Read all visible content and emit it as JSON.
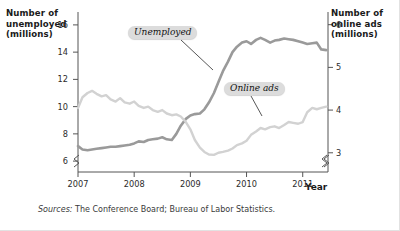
{
  "figure": {
    "sources_prefix": "Sources:",
    "sources_text": " The Conference Board; Bureau of Labor Statistics."
  },
  "chart_data": {
    "type": "line",
    "title": "",
    "xlabel": "Year",
    "ylabel": "Number of unemployed (millions)",
    "y2label": "Number of online ads (millions)",
    "axis_left_title_lines": [
      "Number of",
      "unemployed",
      "(millions)"
    ],
    "axis_right_title_lines": [
      "Number of",
      "online ads",
      "(millions)"
    ],
    "grid": false,
    "legend_position": "inline-annotations",
    "axis_break_left": true,
    "axis_break_right": true,
    "axis_break_x": true,
    "xlim": [
      2007.0,
      2011.45
    ],
    "xticks": [
      2007,
      2008,
      2009,
      2010,
      2011
    ],
    "xtick_labels": [
      "2007",
      "2008",
      "2009",
      "2010",
      "2011"
    ],
    "ylim": [
      5.2,
      16.8
    ],
    "yticks": [
      6,
      8,
      10,
      12,
      14,
      16
    ],
    "ytick_labels": [
      "6",
      "8",
      "10",
      "12",
      "14",
      "16"
    ],
    "y2lim": [
      2.55,
      6.25
    ],
    "y2ticks": [
      3,
      4,
      5,
      6
    ],
    "y2tick_labels": [
      "3",
      "4",
      "5",
      "6"
    ],
    "series": [
      {
        "name": "Unemployed",
        "axis": "left",
        "color": "#9a9a9a",
        "units": "millions",
        "x": [
          2007.0,
          2007.08,
          2007.17,
          2007.25,
          2007.33,
          2007.42,
          2007.5,
          2007.58,
          2007.67,
          2007.75,
          2007.83,
          2007.92,
          2008.0,
          2008.08,
          2008.17,
          2008.25,
          2008.33,
          2008.42,
          2008.5,
          2008.58,
          2008.67,
          2008.75,
          2008.83,
          2008.92,
          2009.0,
          2009.08,
          2009.17,
          2009.25,
          2009.33,
          2009.42,
          2009.5,
          2009.58,
          2009.67,
          2009.75,
          2009.83,
          2009.92,
          2010.0,
          2010.08,
          2010.17,
          2010.25,
          2010.33,
          2010.42,
          2010.5,
          2010.58,
          2010.67,
          2010.75,
          2010.83,
          2010.92,
          2011.0,
          2011.08,
          2011.17,
          2011.25,
          2011.33,
          2011.42
        ],
        "y": [
          7.1,
          6.85,
          6.8,
          6.85,
          6.9,
          6.95,
          7.0,
          7.05,
          7.05,
          7.1,
          7.15,
          7.2,
          7.3,
          7.45,
          7.4,
          7.55,
          7.6,
          7.65,
          7.75,
          7.6,
          7.55,
          8.0,
          8.6,
          9.1,
          9.35,
          9.45,
          9.5,
          9.8,
          10.3,
          11.0,
          11.8,
          12.6,
          13.3,
          14.0,
          14.4,
          14.7,
          14.8,
          14.6,
          14.9,
          15.05,
          14.9,
          14.7,
          14.85,
          14.9,
          15.0,
          14.95,
          14.9,
          14.8,
          14.7,
          14.6,
          14.65,
          14.7,
          14.2,
          14.15
        ],
        "last_value": 14.15,
        "peak_value": 15.05,
        "min_value": 6.8
      },
      {
        "name": "Online ads",
        "axis": "right",
        "color": "#d2d2d2",
        "units": "millions",
        "x": [
          2007.0,
          2007.08,
          2007.17,
          2007.25,
          2007.33,
          2007.42,
          2007.5,
          2007.58,
          2007.67,
          2007.75,
          2007.83,
          2007.92,
          2008.0,
          2008.08,
          2008.17,
          2008.25,
          2008.33,
          2008.42,
          2008.5,
          2008.58,
          2008.67,
          2008.75,
          2008.83,
          2008.92,
          2009.0,
          2009.08,
          2009.17,
          2009.25,
          2009.33,
          2009.42,
          2009.5,
          2009.58,
          2009.67,
          2009.75,
          2009.83,
          2009.92,
          2010.0,
          2010.08,
          2010.17,
          2010.25,
          2010.33,
          2010.42,
          2010.5,
          2010.58,
          2010.67,
          2010.75,
          2010.83,
          2010.92,
          2011.0,
          2011.08,
          2011.17,
          2011.25,
          2011.33,
          2011.42
        ],
        "y": [
          4.05,
          4.3,
          4.4,
          4.45,
          4.38,
          4.32,
          4.35,
          4.25,
          4.2,
          4.28,
          4.18,
          4.15,
          4.2,
          4.1,
          4.05,
          4.08,
          4.0,
          3.96,
          4.0,
          3.92,
          3.88,
          3.9,
          3.85,
          3.72,
          3.55,
          3.3,
          3.12,
          3.02,
          2.96,
          2.95,
          3.0,
          3.02,
          3.05,
          3.1,
          3.18,
          3.22,
          3.28,
          3.42,
          3.5,
          3.58,
          3.55,
          3.6,
          3.62,
          3.58,
          3.65,
          3.72,
          3.7,
          3.68,
          3.72,
          3.95,
          4.05,
          4.02,
          4.05,
          4.08
        ],
        "last_value": 4.08,
        "peak_value": 4.45,
        "min_value": 2.95
      }
    ],
    "annotations": [
      {
        "text": "Unemployed",
        "series": "Unemployed",
        "leader": true
      },
      {
        "text": "Online ads",
        "series": "Online ads",
        "leader": true
      }
    ]
  }
}
